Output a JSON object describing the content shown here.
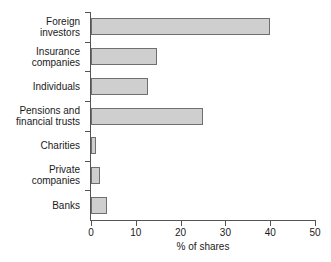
{
  "chart_data": {
    "type": "bar",
    "orientation": "horizontal",
    "title": "",
    "xlabel": "% of shares",
    "ylabel": "",
    "xlim": [
      0,
      50
    ],
    "xticks": [
      "0",
      "10",
      "20",
      "30",
      "40",
      "50"
    ],
    "grid": false,
    "legend": null,
    "bar_fill_color": "#cfcfcf",
    "bar_border_color": "#6f6f6f",
    "axis_color": "#545454",
    "categories": [
      "Foreign\ninvestors",
      "Insurance\ncompanies",
      "Individuals",
      "Pensions and\nfinancial trusts",
      "Charities",
      "Private\ncompanies",
      "Banks"
    ],
    "values": [
      40,
      14.7,
      12.7,
      25,
      1.2,
      2,
      3.5
    ]
  },
  "axis": {
    "x_title": "% of shares",
    "x_tick_0": "0",
    "x_tick_1": "10",
    "x_tick_2": "20",
    "x_tick_3": "30",
    "x_tick_4": "40",
    "x_tick_5": "50"
  },
  "categories": {
    "c0": "Foreign\ninvestors",
    "c1": "Insurance\ncompanies",
    "c2": "Individuals",
    "c3": "Pensions and\nfinancial trusts",
    "c4": "Charities",
    "c5": "Private\ncompanies",
    "c6": "Banks"
  }
}
